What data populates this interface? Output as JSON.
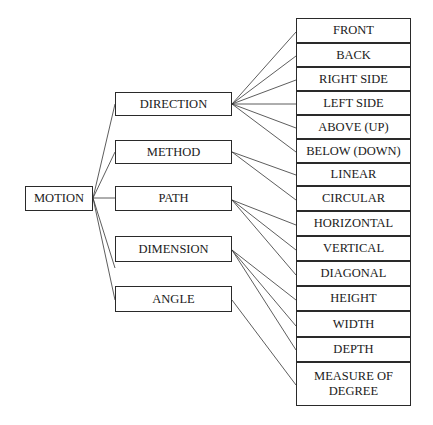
{
  "root": {
    "label": "MOTION"
  },
  "categories": [
    {
      "label": "DIRECTION"
    },
    {
      "label": "METHOD"
    },
    {
      "label": "PATH"
    },
    {
      "label": "DIMENSION"
    },
    {
      "label": "ANGLE"
    }
  ],
  "leaves": [
    {
      "label": "FRONT",
      "parent": "DIRECTION"
    },
    {
      "label": "BACK",
      "parent": "DIRECTION"
    },
    {
      "label": "RIGHT SIDE",
      "parent": "DIRECTION"
    },
    {
      "label": "LEFT SIDE",
      "parent": "DIRECTION"
    },
    {
      "label": "ABOVE (UP)",
      "parent": "DIRECTION"
    },
    {
      "label": "BELOW (DOWN)",
      "parent": "DIRECTION"
    },
    {
      "label": "LINEAR",
      "parent": "METHOD"
    },
    {
      "label": "CIRCULAR",
      "parent": "METHOD"
    },
    {
      "label": "HORIZONTAL",
      "parent": "PATH"
    },
    {
      "label": "VERTICAL",
      "parent": "PATH"
    },
    {
      "label": "DIAGONAL",
      "parent": "PATH"
    },
    {
      "label": "HEIGHT",
      "parent": "DIMENSION"
    },
    {
      "label": "WIDTH",
      "parent": "DIMENSION"
    },
    {
      "label": "DEPTH",
      "parent": "DIMENSION"
    },
    {
      "label": "MEASURE OF DEGREE",
      "parent": "ANGLE"
    }
  ]
}
